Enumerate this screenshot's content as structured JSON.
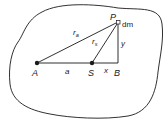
{
  "diagram": {
    "points": [
      {
        "id": "A",
        "label": "A",
        "x": 37,
        "y": 63
      },
      {
        "id": "S",
        "label": "S",
        "x": 92,
        "y": 63
      },
      {
        "id": "B",
        "label": "B",
        "x": 118,
        "y": 63
      },
      {
        "id": "P",
        "label": "P",
        "x": 118,
        "y": 22
      }
    ],
    "segment_labels": {
      "a": "a",
      "x": "x",
      "y": "y",
      "ra_base": "r",
      "ra_sub": "a",
      "rs_base": "r",
      "rs_sub": "s"
    },
    "mass_element_label": "dm",
    "colors": {
      "stroke": "#1a1a1a",
      "background": "#ffffff"
    }
  }
}
